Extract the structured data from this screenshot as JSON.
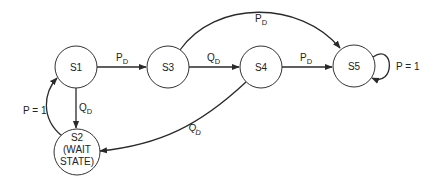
{
  "diagram": {
    "type": "state-transition",
    "states": [
      {
        "id": "S1",
        "label": "S1"
      },
      {
        "id": "S2",
        "label": "S2",
        "line2": "(WAIT",
        "line3": "STATE)"
      },
      {
        "id": "S3",
        "label": "S3"
      },
      {
        "id": "S4",
        "label": "S4"
      },
      {
        "id": "S5",
        "label": "S5"
      }
    ],
    "transitions": [
      {
        "from": "S1",
        "to": "S3",
        "label": "P",
        "sub": "D"
      },
      {
        "from": "S3",
        "to": "S4",
        "label": "Q",
        "sub": "D"
      },
      {
        "from": "S4",
        "to": "S5",
        "label": "P",
        "sub": "D"
      },
      {
        "from": "S3",
        "to": "S5",
        "label": "P",
        "sub": "D"
      },
      {
        "from": "S1",
        "to": "S2",
        "label": "Q",
        "sub": "D"
      },
      {
        "from": "S2",
        "to": "S1",
        "label": "P = 1"
      },
      {
        "from": "S4",
        "to": "S2",
        "label": "Q",
        "sub": "D"
      },
      {
        "from": "S5",
        "to": "S5",
        "label": "P = 1"
      }
    ]
  }
}
